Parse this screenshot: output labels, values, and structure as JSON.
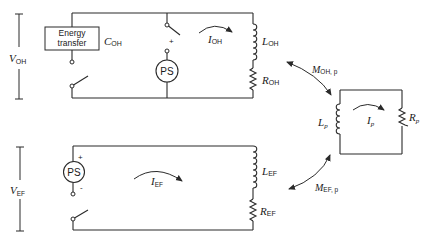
{
  "figure": {
    "type": "equivalent-circuit-diagram"
  },
  "oh_circuit": {
    "voltage_label": "V",
    "voltage_sub": "OH",
    "energy_box_line1": "Energy",
    "energy_box_line2": "transfer",
    "capacitor_label": "C",
    "capacitor_sub": "OH",
    "power_supply_label": "PS",
    "plus_sign": "+",
    "current_label": "I",
    "current_sub": "OH",
    "inductor_label": "L",
    "inductor_sub": "OH",
    "resistor_label": "R",
    "resistor_sub": "OH"
  },
  "ef_circuit": {
    "voltage_label": "V",
    "voltage_sub": "EF",
    "power_supply_label": "PS",
    "plus_sign": "+",
    "minus_sign": "-",
    "current_label": "I",
    "current_sub": "EF",
    "inductor_label": "L",
    "inductor_sub": "EF",
    "resistor_label": "R",
    "resistor_sub": "EF"
  },
  "plasma_circuit": {
    "inductor_label": "L",
    "inductor_sub": "p",
    "current_label": "I",
    "current_sub": "p",
    "resistor_label": "R",
    "resistor_sub": "p"
  },
  "coupling": {
    "oh_p_label": "M",
    "oh_p_sub": "OH, p",
    "ef_p_label": "M",
    "ef_p_sub": "EF, p"
  }
}
